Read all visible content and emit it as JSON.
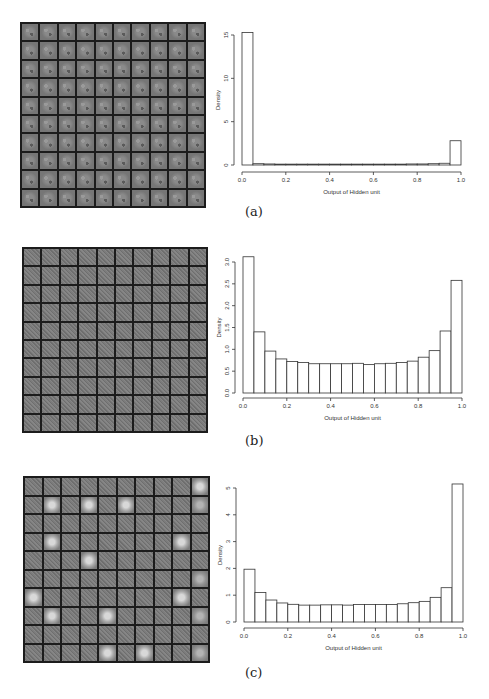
{
  "panels": [
    {
      "id": "a",
      "caption": "(a)",
      "grid": {
        "rows": 10,
        "cols": 10,
        "style": "digit-like filters",
        "bright_tiles": [],
        "mid_tiles": []
      },
      "chart": {
        "ylabel": "Density",
        "xlabel": "Output of Hidden unit",
        "xticks": [
          "0.0",
          "0.2",
          "0.4",
          "0.6",
          "0.8",
          "1.0"
        ],
        "yticks": [
          "0",
          "5",
          "10",
          "15"
        ]
      }
    },
    {
      "id": "b",
      "caption": "(b)",
      "grid": {
        "rows": 10,
        "cols": 10,
        "style": "noise-like filters",
        "bright_tiles": [],
        "mid_tiles": []
      },
      "chart": {
        "ylabel": "Density",
        "xlabel": "Output of Hidden unit",
        "xticks": [
          "0.0",
          "0.2",
          "0.4",
          "0.6",
          "0.8",
          "1.0"
        ],
        "yticks": [
          "0.0",
          "0.5",
          "1.0",
          "1.5",
          "2.0",
          "2.5",
          "3.0"
        ]
      }
    },
    {
      "id": "c",
      "caption": "(c)",
      "grid": {
        "rows": 10,
        "cols": 10,
        "style": "noise-like filters with blob filters",
        "bright_tiles": [
          [
            0,
            9
          ],
          [
            1,
            1
          ],
          [
            1,
            3
          ],
          [
            1,
            5
          ],
          [
            3,
            1
          ],
          [
            3,
            8
          ],
          [
            4,
            3
          ],
          [
            6,
            0
          ],
          [
            6,
            8
          ],
          [
            7,
            1
          ],
          [
            7,
            4
          ],
          [
            9,
            4
          ],
          [
            9,
            6
          ]
        ],
        "mid_tiles": [
          [
            1,
            9
          ],
          [
            5,
            9
          ],
          [
            7,
            9
          ],
          [
            9,
            9
          ]
        ]
      },
      "chart": {
        "ylabel": "Density",
        "xlabel": "Output of Hidden unit",
        "xticks": [
          "0.0",
          "0.2",
          "0.4",
          "0.6",
          "0.8",
          "1.0"
        ],
        "yticks": [
          "0",
          "1",
          "2",
          "3",
          "4",
          "5"
        ]
      }
    }
  ],
  "chart_data": [
    {
      "type": "bar",
      "title": "(a)",
      "xlabel": "Output of Hidden unit",
      "ylabel": "Density",
      "xlim": [
        0,
        1
      ],
      "ylim": [
        0,
        15
      ],
      "bin_width": 0.05,
      "categories": [
        "0.00-0.05",
        "0.05-0.10",
        "0.10-0.15",
        "0.15-0.20",
        "0.20-0.25",
        "0.25-0.30",
        "0.30-0.35",
        "0.35-0.40",
        "0.40-0.45",
        "0.45-0.50",
        "0.50-0.55",
        "0.55-0.60",
        "0.60-0.65",
        "0.65-0.70",
        "0.70-0.75",
        "0.75-0.80",
        "0.80-0.85",
        "0.85-0.90",
        "0.90-0.95",
        "0.95-1.00"
      ],
      "values": [
        15.3,
        0.15,
        0.12,
        0.1,
        0.1,
        0.1,
        0.1,
        0.1,
        0.1,
        0.1,
        0.1,
        0.1,
        0.1,
        0.1,
        0.1,
        0.12,
        0.12,
        0.15,
        0.2,
        2.8
      ],
      "grid": false
    },
    {
      "type": "bar",
      "title": "(b)",
      "xlabel": "Output of Hidden unit",
      "ylabel": "Density",
      "xlim": [
        0,
        1
      ],
      "ylim": [
        0,
        3.0
      ],
      "bin_width": 0.05,
      "categories": [
        "0.00-0.05",
        "0.05-0.10",
        "0.10-0.15",
        "0.15-0.20",
        "0.20-0.25",
        "0.25-0.30",
        "0.30-0.35",
        "0.35-0.40",
        "0.40-0.45",
        "0.45-0.50",
        "0.50-0.55",
        "0.55-0.60",
        "0.60-0.65",
        "0.65-0.70",
        "0.70-0.75",
        "0.75-0.80",
        "0.80-0.85",
        "0.85-0.90",
        "0.90-0.95",
        "0.95-1.00"
      ],
      "values": [
        3.12,
        1.4,
        0.96,
        0.78,
        0.72,
        0.7,
        0.67,
        0.67,
        0.67,
        0.67,
        0.68,
        0.65,
        0.67,
        0.68,
        0.7,
        0.73,
        0.82,
        0.97,
        1.42,
        2.58
      ],
      "grid": false
    },
    {
      "type": "bar",
      "title": "(c)",
      "xlabel": "Output of Hidden unit",
      "ylabel": "Density",
      "xlim": [
        0,
        1
      ],
      "ylim": [
        0,
        5
      ],
      "bin_width": 0.05,
      "categories": [
        "0.00-0.05",
        "0.05-0.10",
        "0.10-0.15",
        "0.15-0.20",
        "0.20-0.25",
        "0.25-0.30",
        "0.30-0.35",
        "0.35-0.40",
        "0.40-0.45",
        "0.45-0.50",
        "0.50-0.55",
        "0.55-0.60",
        "0.60-0.65",
        "0.65-0.70",
        "0.70-0.75",
        "0.75-0.80",
        "0.80-0.85",
        "0.85-0.90",
        "0.90-0.95",
        "0.95-1.00"
      ],
      "values": [
        1.97,
        1.1,
        0.82,
        0.71,
        0.66,
        0.63,
        0.63,
        0.64,
        0.64,
        0.63,
        0.65,
        0.65,
        0.65,
        0.65,
        0.68,
        0.72,
        0.77,
        0.92,
        1.28,
        5.15
      ],
      "grid": false
    }
  ]
}
